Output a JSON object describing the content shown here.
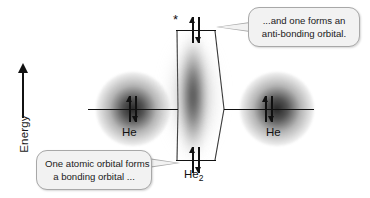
{
  "axis": {
    "label": "Energy",
    "direction_icon": "up-arrow-icon"
  },
  "diagram": {
    "type": "molecular-orbital-correlation-diagram",
    "left_atom": {
      "label": "He",
      "electrons": "2",
      "spin_pair": "↑↓"
    },
    "right_atom": {
      "label": "He",
      "electrons": "2",
      "spin_pair": "↑↓"
    },
    "molecule": {
      "label": "He",
      "subscript": "2"
    },
    "antibonding": {
      "star": "*",
      "spin_pair": "↑↓"
    },
    "bonding": {
      "spin_pair": "↑↓"
    }
  },
  "callouts": {
    "top": {
      "line1": "...and one forms an",
      "line2": "anti-bonding orbital."
    },
    "bottom": {
      "line1": "One atomic orbital forms",
      "line2": "a bonding orbital ..."
    }
  },
  "colors": {
    "ink": "#111111",
    "bubble_fill": "#f2f2f2",
    "bubble_border": "#a8a8a8",
    "background": "#ffffff"
  }
}
